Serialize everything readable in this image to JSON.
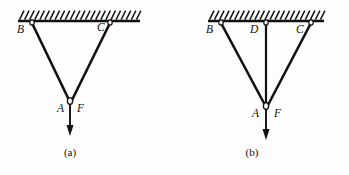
{
  "figure": {
    "background_color": "#fdfdfd",
    "ink_color": "#111111",
    "panels": [
      {
        "id": "a",
        "caption": "(a)",
        "caption_x": 70,
        "caption_y": 156,
        "ceiling": {
          "x1": 18,
          "y1": 21,
          "x2": 140,
          "y2": 21,
          "hatch_count": 24,
          "hatch_length": 9,
          "hatch_lean": "right"
        },
        "nodes": [
          {
            "label": "B",
            "label_x": 17,
            "label_y": 33,
            "anchor_x": 32,
            "anchor_y": 22
          },
          {
            "label": "C",
            "label_x": 97,
            "label_y": 31,
            "anchor_x": 110,
            "anchor_y": 22
          },
          {
            "label": "A",
            "label_x": 57,
            "label_y": 112,
            "anchor_x": 70,
            "anchor_y": 101
          }
        ],
        "ropes": [
          {
            "from": "B",
            "x1": 32,
            "y1": 23,
            "x2": 69,
            "y2": 100
          },
          {
            "from": "C",
            "x1": 110,
            "y1": 23,
            "x2": 72,
            "y2": 100
          }
        ],
        "force": {
          "label": "F",
          "label_x": 77,
          "label_y": 112,
          "x": 70,
          "y_start": 104,
          "y_end": 136,
          "head_width": 7,
          "head_length": 11
        }
      },
      {
        "id": "b",
        "caption": "(b)",
        "caption_x": 78,
        "caption_y": 156,
        "ceiling": {
          "x1": 34,
          "y1": 21,
          "x2": 150,
          "y2": 21,
          "hatch_count": 23,
          "hatch_length": 9,
          "hatch_lean": "right"
        },
        "nodes": [
          {
            "label": "B",
            "label_x": 32,
            "label_y": 33,
            "anchor_x": 47,
            "anchor_y": 22
          },
          {
            "label": "D",
            "label_x": 76,
            "label_y": 33,
            "anchor_x": 92,
            "anchor_y": 22
          },
          {
            "label": "C",
            "label_x": 122,
            "label_y": 33,
            "anchor_x": 137,
            "anchor_y": 22
          },
          {
            "label": "A",
            "label_x": 78,
            "label_y": 117,
            "anchor_x": 92,
            "anchor_y": 106
          }
        ],
        "ropes": [
          {
            "from": "B",
            "x1": 47,
            "y1": 23,
            "x2": 91,
            "y2": 105
          },
          {
            "from": "D",
            "x1": 92,
            "y1": 23,
            "x2": 92,
            "y2": 105
          },
          {
            "from": "C",
            "x1": 137,
            "y1": 23,
            "x2": 94,
            "y2": 105
          }
        ],
        "force": {
          "label": "F",
          "label_x": 100,
          "label_y": 117,
          "x": 92,
          "y_start": 109,
          "y_end": 140,
          "head_width": 7,
          "head_length": 11
        }
      }
    ]
  }
}
